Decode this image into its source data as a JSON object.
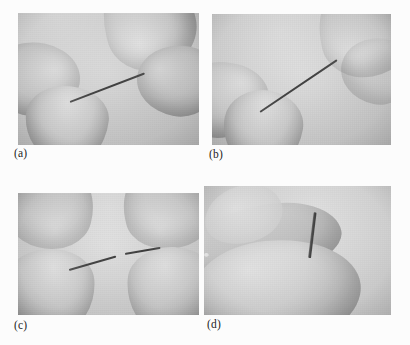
{
  "figure": {
    "kind": "photo-plate",
    "caption_labels": [
      "(a)",
      "(b)",
      "(c)",
      "(d)"
    ],
    "background_color": "#fcfcfc",
    "label_color": "#1d1d1d",
    "panels": [
      {
        "id": "a",
        "label": "(a)",
        "alt": "Grayscale photo: a thin straight wire held horizontally between the thumb and index finger of two hands",
        "subject": "thin metal wire held straight between fingertips",
        "tone": "grayscale"
      },
      {
        "id": "b",
        "label": "(b)",
        "alt": "Grayscale photo: the wire held at a steeper diagonal angle as the fingers begin to bend it",
        "subject": "wire being bent between fingertips at a diagonal",
        "tone": "grayscale"
      },
      {
        "id": "c",
        "label": "(c)",
        "alt": "Grayscale photo: the wire has fractured, showing a visible gap between the two broken ends held by the fingers",
        "subject": "fractured wire showing a gap between the two broken halves",
        "tone": "grayscale"
      },
      {
        "id": "d",
        "label": "(d)",
        "alt": "Grayscale photo: a single fingertip with a short wire stub standing upright, bright fractured tip visible",
        "subject": "short broken wire stub upright on a fingertip with bright fracture surface",
        "tone": "grayscale"
      }
    ]
  }
}
